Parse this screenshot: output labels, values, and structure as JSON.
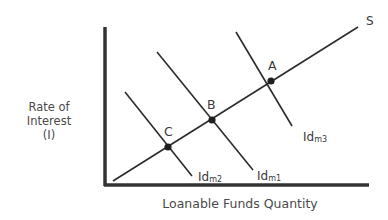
{
  "diagram": {
    "title": "",
    "y_axis_label": [
      "Rate of",
      "Interest",
      "(I)"
    ],
    "x_axis_label": "Loanable Funds Quantity",
    "supply_curve": {
      "label": "S"
    },
    "demand_curves": [
      {
        "label": "Id",
        "sub": "m2"
      },
      {
        "label": "Id",
        "sub": "m1"
      },
      {
        "label": "Id",
        "sub": "m3"
      }
    ],
    "points": [
      {
        "label": "A"
      },
      {
        "label": "B"
      },
      {
        "label": "C"
      }
    ],
    "colors": {
      "line": "#2b2b2b",
      "axis": "#333333",
      "text": "#4a4a4a"
    }
  }
}
